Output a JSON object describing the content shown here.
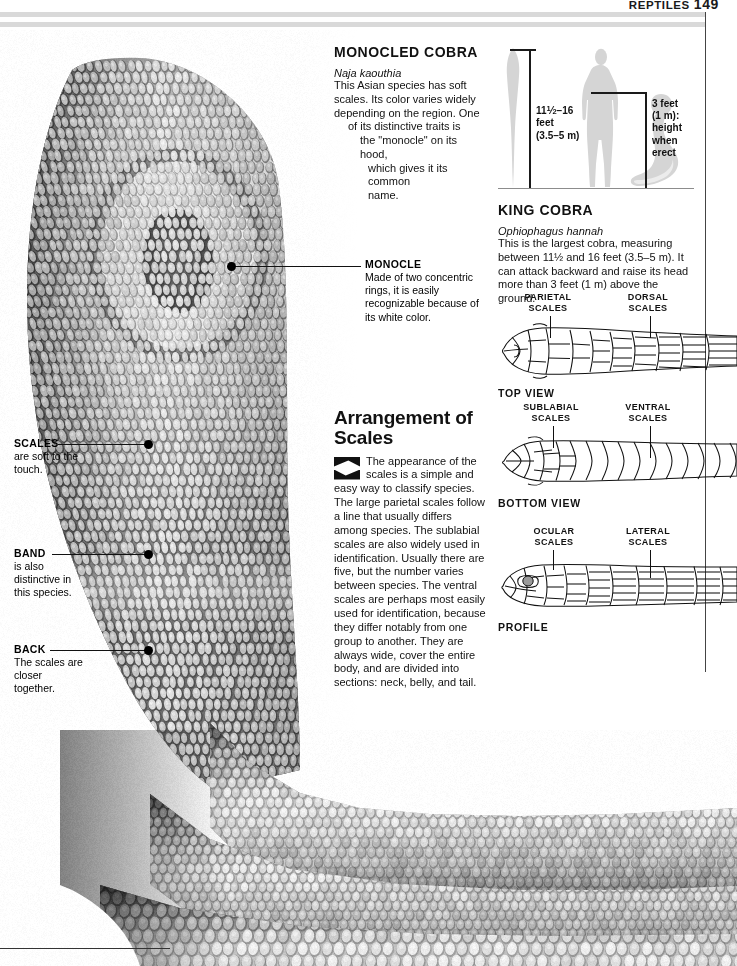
{
  "running_head": {
    "title": "REPTILES",
    "folio": "149"
  },
  "monocled_cobra": {
    "heading": "MONOCLED COBRA",
    "scientific_name": "Naja kaouthia",
    "body_lines": [
      "This Asian species has soft",
      "scales. Its color varies widely",
      "depending on the region. One",
      "of its distinctive traits is",
      "the \"monocle\" on its hood,",
      "which gives it its common",
      "name."
    ]
  },
  "callouts": [
    {
      "title": "SCALES",
      "body": "are soft to the touch."
    },
    {
      "title": "BAND",
      "body": "is also distinctive in this species."
    },
    {
      "title": "BACK",
      "body": "The scales are closer together."
    }
  ],
  "monocle_callout": {
    "title": "MONOCLE",
    "body": "Made of two concentric rings, it is easily recognizable because of its white color."
  },
  "arrangement": {
    "title_line1": "Arrangement of",
    "title_line2": "Scales",
    "body": "The appearance of the scales is a simple and easy way to classify species. The large parietal scales follow a line that usually differs among species. The sublabial scales are also widely used in identification. Usually there are five, but the number varies between species. The ventral scales are perhaps most easily used for identification, because they differ notably from one group to another. They are always wide, cover the entire body, and are divided into sections: neck, belly, and tail."
  },
  "king_cobra": {
    "heading": "KING COBRA",
    "scientific_name": "Ophiophagus hannah",
    "body": "This is the largest cobra, measuring between 11½ and 16 feet (3.5–5 m). It can attack backward and raise its head more than 3 feet (1 m) above the ground.",
    "length_label_line1": "feet",
    "length_label_line2": "(3.5–5 m)",
    "length_value": "11½–16",
    "height_label_lines": [
      "3 feet",
      "(1 m):",
      "height",
      "when",
      "erect"
    ]
  },
  "scale_views": [
    {
      "caption": "TOP VIEW",
      "labels": [
        {
          "text_line1": "PARIETAL",
          "text_line2": "SCALES"
        },
        {
          "text_line1": "DORSAL",
          "text_line2": "SCALES"
        }
      ]
    },
    {
      "caption": "BOTTOM VIEW",
      "labels": [
        {
          "text_line1": "SUBLABIAL",
          "text_line2": "SCALES"
        },
        {
          "text_line1": "VENTRAL",
          "text_line2": "SCALES"
        }
      ]
    },
    {
      "caption": "PROFILE",
      "labels": [
        {
          "text_line1": "OCULAR",
          "text_line2": "SCALES"
        },
        {
          "text_line1": "LATERAL",
          "text_line2": "SCALES"
        }
      ]
    }
  ],
  "colors": {
    "ink": "#111111",
    "rule_gray": "#d9d9d9",
    "silhouette_gray": "#d5d5d5",
    "diagram_line": "#1a1a1a"
  }
}
